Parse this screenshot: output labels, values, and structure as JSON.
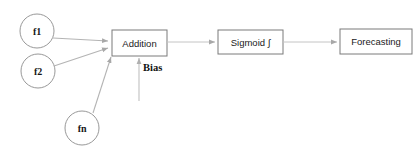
{
  "diagram": {
    "type": "flowchart",
    "background_color": "#ffffff",
    "stroke_color": "#808080",
    "box_stroke_color": "#7a7a7a",
    "connector_color": "#b8b8b8",
    "text_color": "#1a1a1a",
    "inputs": [
      {
        "id": "f1",
        "label": "f1",
        "shape": "circle",
        "cx": 37,
        "cy": 31,
        "r": 17
      },
      {
        "id": "f2",
        "label": "f2",
        "shape": "circle",
        "cx": 38,
        "cy": 71,
        "r": 17
      },
      {
        "id": "fn",
        "label": "fn",
        "shape": "circle",
        "cx": 82,
        "cy": 128,
        "r": 17
      }
    ],
    "blocks": [
      {
        "id": "addition",
        "label": "Addition",
        "shape": "rect",
        "x": 112,
        "y": 30,
        "w": 55,
        "h": 26
      },
      {
        "id": "sigmoid",
        "label": "Sigmoid ∫",
        "shape": "rect",
        "x": 218,
        "y": 30,
        "w": 65,
        "h": 24
      },
      {
        "id": "forecasting",
        "label": "Forecasting",
        "shape": "rect",
        "x": 340,
        "y": 29,
        "w": 72,
        "h": 25
      }
    ],
    "bias": {
      "id": "bias",
      "label": "Bias",
      "label_x": 146,
      "label_y": 66,
      "arrow_from_y": 100,
      "arrow_to_y": 57,
      "arrow_x": 139
    },
    "edges": [
      {
        "id": "f1-to-addition",
        "from": "f1",
        "to": "addition",
        "style": "line-arrow"
      },
      {
        "id": "f2-to-addition",
        "from": "f2",
        "to": "addition",
        "style": "line-arrow"
      },
      {
        "id": "fn-to-addition",
        "from": "fn",
        "to": "addition",
        "style": "line-arrow"
      },
      {
        "id": "bias-to-addition",
        "from": "bias",
        "to": "addition",
        "style": "line-arrow"
      },
      {
        "id": "addition-to-sigmoid",
        "from": "addition",
        "to": "sigmoid",
        "style": "line-arrow"
      },
      {
        "id": "sigmoid-to-forecasting",
        "from": "sigmoid",
        "to": "forecasting",
        "style": "line-arrow"
      }
    ]
  }
}
